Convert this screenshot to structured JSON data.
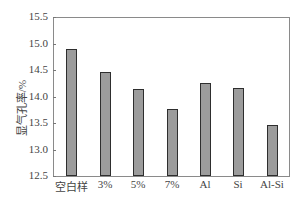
{
  "chart_data": {
    "type": "bar",
    "title": "",
    "xlabel": "",
    "ylabel": "显气孔率/%",
    "categories": [
      "空白样",
      "3%",
      "5%",
      "7%",
      "Al",
      "Si",
      "Al-Si"
    ],
    "values": [
      14.9,
      14.47,
      14.15,
      13.77,
      14.26,
      14.16,
      13.47
    ],
    "ylim": [
      12.5,
      15.5
    ],
    "yticks": [
      "12.5",
      "13.0",
      "13.5",
      "14.0",
      "14.5",
      "15.0",
      "15.5"
    ],
    "grid": false,
    "legend": null,
    "bar_color": "#9c9c9c",
    "bar_edge_color": "#2e2e2e"
  }
}
